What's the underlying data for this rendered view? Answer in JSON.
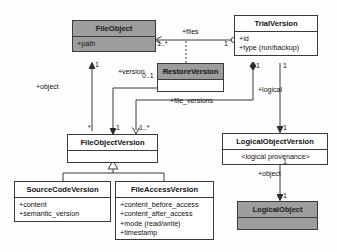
{
  "diagram": {
    "type": "uml-class-diagram",
    "colors": {
      "shaded_fill": "#9d9d9d",
      "plain_fill": "#ffffff",
      "stroke": "#3a3a3a",
      "background": "#fdfdfd"
    }
  },
  "classes": [
    {
      "id": "file_object",
      "name": "FileObject",
      "style": "shaded",
      "attributes": [
        "+path"
      ]
    },
    {
      "id": "trial_version",
      "name": "TrialVersion",
      "style": "plain",
      "attributes": [
        "+id",
        "+type (run/backup)"
      ]
    },
    {
      "id": "restore_version",
      "name": "RestoreVersion",
      "style": "shaded-header",
      "attributes": []
    },
    {
      "id": "file_object_version",
      "name": "FileObjectVersion",
      "style": "plain",
      "attributes": []
    },
    {
      "id": "logical_object_version",
      "name": "LogicalObjectVersion",
      "style": "plain",
      "attributes": [
        "<logical provenance>"
      ]
    },
    {
      "id": "source_code_version",
      "name": "SourceCodeVersion",
      "style": "plain",
      "attributes": [
        "+content",
        "+semantic_version"
      ]
    },
    {
      "id": "file_access_version",
      "name": "FileAccessVersion",
      "style": "plain",
      "attributes": [
        "+content_before_access",
        "+content_after_access",
        "+mode (read/write)",
        "+timestamp"
      ]
    },
    {
      "id": "logical_object",
      "name": "LogicalObject",
      "style": "shaded",
      "attributes": []
    }
  ],
  "associations": [
    {
      "id": "files",
      "role": "+files",
      "from": "trial_version",
      "to": "file_object",
      "from_multiplicity": "1",
      "to_multiplicity": "1..*"
    },
    {
      "id": "version",
      "role": "+version",
      "from": "restore_version",
      "to": "file_object_version",
      "from_multiplicity": "0..1",
      "to_multiplicity": "1"
    },
    {
      "id": "object",
      "role": "+object",
      "from": "file_object_version",
      "to": "file_object",
      "from_multiplicity": "*",
      "to_multiplicity": "1"
    },
    {
      "id": "file_versions",
      "role": "+file_versions",
      "from": "trial_version",
      "to": "file_object_version",
      "from_multiplicity": "1",
      "to_multiplicity": "1..*"
    },
    {
      "id": "logical",
      "role": "+logical",
      "from": "trial_version",
      "to": "logical_object_version",
      "from_multiplicity": "1",
      "to_multiplicity": "1"
    },
    {
      "id": "logical_object_ref",
      "role": "+object",
      "from": "logical_object_version",
      "to": "logical_object",
      "from_multiplicity": "1",
      "to_multiplicity": "1"
    }
  ],
  "generalizations": [
    {
      "id": "gen_scv",
      "parent": "file_object_version",
      "child": "source_code_version"
    },
    {
      "id": "gen_fav",
      "parent": "file_object_version",
      "child": "file_access_version"
    }
  ],
  "labels": {
    "files": "+files",
    "version": "+version",
    "object_left": "+object",
    "file_versions": "+file_versions",
    "logical": "+logical",
    "object_right": "+object"
  },
  "multiplicities": {
    "files_target": "1..*",
    "files_source": "1",
    "version_restore": "0..1",
    "object_fo": "1",
    "object_fov": "*",
    "version_fov": "1",
    "file_versions_fov": "1..*",
    "file_versions_tv": "1",
    "logical_tv": "1",
    "logical_lov": "1",
    "lov_bottom": "1",
    "lo_top": "1"
  }
}
